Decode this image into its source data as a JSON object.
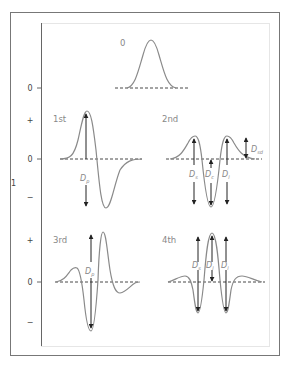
{
  "diagram": {
    "title": "",
    "panels": [
      {
        "id": "p0",
        "label": "0",
        "description": "Gaussian (zeroth derivative)"
      },
      {
        "id": "p1",
        "label": "1st",
        "description": "First derivative",
        "measures": [
          {
            "symbol": "D",
            "sub": "p"
          }
        ]
      },
      {
        "id": "p2",
        "label": "2nd",
        "description": "Second derivative",
        "measures": [
          {
            "symbol": "D",
            "sub": "s"
          },
          {
            "symbol": "D",
            "sub": "c"
          },
          {
            "symbol": "D",
            "sub": "l"
          },
          {
            "symbol": "D",
            "sub": "sd"
          }
        ]
      },
      {
        "id": "p3",
        "label": "3rd",
        "description": "Third derivative",
        "measures": [
          {
            "symbol": "D",
            "sub": "p"
          }
        ]
      },
      {
        "id": "p4",
        "label": "4th",
        "description": "Fourth derivative",
        "measures": [
          {
            "symbol": "D",
            "sub": "s"
          },
          {
            "symbol": "D",
            "sub": "l"
          },
          {
            "symbol": "D",
            "sub": "l"
          }
        ]
      }
    ],
    "axis": {
      "label": "1",
      "ticks": [
        {
          "text": "0",
          "y": 88
        },
        {
          "text": "+",
          "y": 120
        },
        {
          "text": "0",
          "y": 159
        },
        {
          "text": "−",
          "y": 197
        },
        {
          "text": "+",
          "y": 240
        },
        {
          "text": "0",
          "y": 282
        },
        {
          "text": "−",
          "y": 322
        }
      ]
    },
    "colors": {
      "curve": "#8a8a8a",
      "arrow": "#222222",
      "frame": "#777777",
      "text": "#888888"
    }
  }
}
